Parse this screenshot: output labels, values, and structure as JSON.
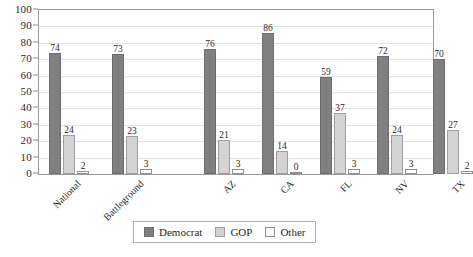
{
  "chart_data": {
    "type": "bar",
    "title": "",
    "xlabel": "",
    "ylabel": "",
    "ylim": [
      0,
      100
    ],
    "ytick_step": 10,
    "yticks": [
      100,
      90,
      80,
      70,
      60,
      50,
      40,
      30,
      20,
      10,
      0
    ],
    "grid": true,
    "legend_position": "bottom",
    "categories": [
      "National",
      "Battleground",
      "AZ",
      "CA",
      "FL",
      "NV",
      "TX"
    ],
    "series": [
      {
        "name": "Democrat",
        "color": "#808080",
        "values": [
          74,
          73,
          76,
          86,
          59,
          72,
          70
        ]
      },
      {
        "name": "GOP",
        "color": "#d4d4d4",
        "values": [
          24,
          23,
          21,
          14,
          37,
          24,
          27
        ]
      },
      {
        "name": "Other",
        "color": "#ffffff",
        "values": [
          2,
          3,
          3,
          0,
          3,
          3,
          2
        ]
      }
    ]
  },
  "legend": {
    "items": [
      {
        "label": "Democrat",
        "swatch": "democrat"
      },
      {
        "label": "GOP",
        "swatch": "gop"
      },
      {
        "label": "Other",
        "swatch": "other"
      }
    ]
  },
  "caption": {
    "text": ""
  }
}
